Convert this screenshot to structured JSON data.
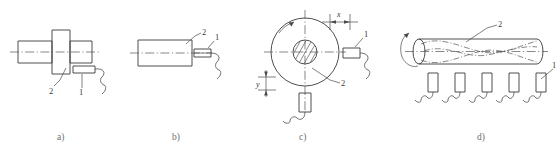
{
  "figure": {
    "background_color": "#ffffff",
    "line_color": "#3a3a3a",
    "center_line_color": "#555555",
    "caption_color": "#6e6e6e"
  },
  "panels": [
    {
      "id": "a",
      "caption": "a)",
      "description": "stepped shaft with flange, tool approaching from right",
      "callouts": [
        {
          "key": "workpiece",
          "label": "2"
        },
        {
          "key": "tool",
          "label": "1"
        }
      ]
    },
    {
      "id": "b",
      "caption": "b)",
      "description": "cylindrical bar end, tool at right face",
      "callouts": [
        {
          "key": "workpiece",
          "label": "2"
        },
        {
          "key": "tool",
          "label": "1"
        }
      ]
    },
    {
      "id": "c",
      "caption": "c)",
      "description": "end view of rotating disc with two tools and offset dimensions",
      "callouts": [
        {
          "key": "workpiece",
          "label": "2"
        },
        {
          "key": "tool",
          "label": "1"
        }
      ],
      "dimensions": [
        {
          "key": "horizontal-offset",
          "label": "x"
        },
        {
          "key": "vertical-offset",
          "label": "y"
        }
      ]
    },
    {
      "id": "d",
      "caption": "d)",
      "description": "rotating shaft with wavy surface profile and five tools in a row",
      "callouts": [
        {
          "key": "workpiece",
          "label": "2"
        },
        {
          "key": "tool",
          "label": "1"
        }
      ],
      "tool_count": 5
    }
  ],
  "icons": {
    "rotation_arrow": "rotation-arrow-icon",
    "hatching": "section-hatching-icon",
    "centerline": "centerline-icon",
    "dimension_arrow": "dimension-arrow-icon",
    "tool_holder_squiggle": "tool-holder-icon"
  }
}
